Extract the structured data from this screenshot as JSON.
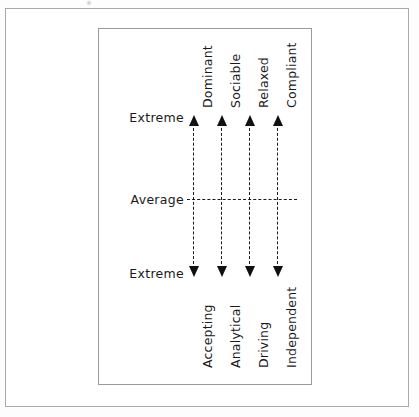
{
  "diagram": {
    "scale_labels": {
      "top": "Extreme",
      "middle": "Average",
      "bottom": "Extreme"
    },
    "axes": [
      {
        "id": "dominance",
        "top_label": "Dominant",
        "bottom_label": "Accepting"
      },
      {
        "id": "sociability",
        "top_label": "Sociable",
        "bottom_label": "Analytical"
      },
      {
        "id": "relaxation",
        "top_label": "Relaxed",
        "bottom_label": "Driving"
      },
      {
        "id": "compliance",
        "top_label": "Compliant",
        "bottom_label": "Independent"
      }
    ],
    "colors": {
      "ink": "#1a1a1a",
      "frame": "#9a9a9a",
      "outer_frame": "#a9a9a9",
      "background": "#ffffff"
    }
  }
}
